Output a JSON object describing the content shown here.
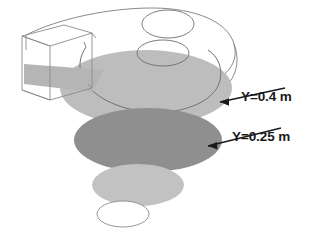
{
  "figure": {
    "background_color": "#ffffff",
    "outline_color": "#6e6e6e",
    "duct": {
      "name": "rectangular-inlet-duct",
      "description": "wireframe rectangular inlet duct at upper left",
      "stroke": "#8a8a8a",
      "band_fill": "#b5b5b5"
    },
    "volute": {
      "name": "spiral-volute-shell",
      "description": "spiral scroll housing outline seen in 3D perspective",
      "stroke": "#7d7d7d"
    },
    "inlet_eye": {
      "name": "circular-inlet-eye",
      "description": "circular suction eye on top surface of volute",
      "stroke": "#6e6e6e"
    }
  },
  "planes": [
    {
      "id": "plane-y040",
      "label": "Y=0.4 m",
      "fill": "#bdbdbd",
      "stroke": "none",
      "order": 1,
      "description": "upper light-gray horizontal cut plane through volute"
    },
    {
      "id": "plane-y025",
      "label": "Y=0.25 m",
      "fill": "#8f8f8f",
      "stroke": "none",
      "order": 2,
      "description": "middle dark-gray horizontal cut plane"
    },
    {
      "id": "plane-lower-shaded",
      "label": "",
      "fill": "#c2c2c2",
      "stroke": "none",
      "order": 3,
      "description": "lower light-gray unlabeled cut plane"
    },
    {
      "id": "plane-bottom-outline",
      "label": "",
      "fill": "#ffffff",
      "stroke": "#8a8a8a",
      "order": 4,
      "description": "bottom outlined-only ellipse (discharge opening)"
    }
  ],
  "annotations": [
    {
      "id": "annotation-y040",
      "text": "Y=0.4 m",
      "text_x": 241,
      "text_y": 101,
      "arrow_from_x": 285,
      "arrow_from_y": 88,
      "arrow_to_x": 218,
      "arrow_to_y": 103,
      "color": "#1a1a1a"
    },
    {
      "id": "annotation-y025",
      "text": "Y=0.25 m",
      "text_x": 232,
      "text_y": 141,
      "arrow_from_x": 281,
      "arrow_from_y": 128,
      "arrow_to_x": 206,
      "arrow_to_y": 147,
      "color": "#1a1a1a"
    }
  ],
  "colors": {
    "accent_dark_gray": "#8f8f8f",
    "accent_light_gray": "#bdbdbd",
    "outline_gray": "#7d7d7d",
    "text_black": "#1a1a1a",
    "background": "#ffffff"
  }
}
